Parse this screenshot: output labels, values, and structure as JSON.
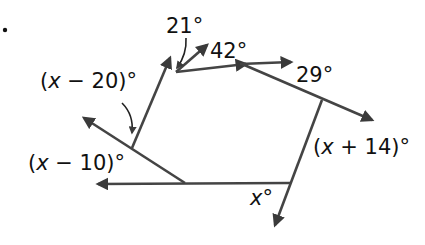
{
  "problem": {
    "marker": "."
  },
  "diagram": {
    "type": "polygon exterior angles",
    "line_color": "#444444",
    "arrow_color": "#3a3a3a",
    "angles": [
      {
        "id": "a1",
        "var": "x",
        "op": " − ",
        "num": "20",
        "deg": "°",
        "full": "(x − 20)°"
      },
      {
        "id": "a2",
        "text": "21°"
      },
      {
        "id": "a3",
        "text": "42°"
      },
      {
        "id": "a4",
        "text": "29°"
      },
      {
        "id": "a5",
        "var": "x",
        "op": " + ",
        "num": "14",
        "deg": "°",
        "full": "(x + 14)°"
      },
      {
        "id": "a6",
        "var": "x",
        "deg": "°",
        "full": "x°"
      },
      {
        "id": "a7",
        "var": "x",
        "op": " − ",
        "num": "10",
        "deg": "°",
        "full": "(x − 10)°"
      }
    ]
  }
}
